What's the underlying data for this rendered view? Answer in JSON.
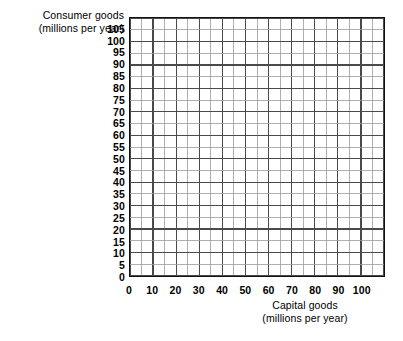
{
  "chart_data": {
    "type": "grid",
    "title": "",
    "ylabel_line1": "Consumer goods",
    "ylabel_line2": "(millions per year)",
    "xlabel_line1": "Capital goods",
    "xlabel_line2": "(millions per year)",
    "xlim": [
      0,
      110
    ],
    "ylim": [
      0,
      110
    ],
    "x_major_step": 10,
    "x_minor_step": 5,
    "y_major_step": 10,
    "y_minor_step": 5,
    "xticklabels": [
      "0",
      "10",
      "20",
      "30",
      "40",
      "50",
      "60",
      "70",
      "80",
      "90",
      "100"
    ],
    "xtickvalues": [
      0,
      10,
      20,
      30,
      40,
      50,
      60,
      70,
      80,
      90,
      100
    ],
    "yticklabels": [
      "0",
      "5",
      "10",
      "15",
      "20",
      "25",
      "30",
      "35",
      "40",
      "45",
      "50",
      "55",
      "60",
      "65",
      "70",
      "75",
      "80",
      "85",
      "90",
      "95",
      "100",
      "105"
    ],
    "ytickvalues": [
      0,
      5,
      10,
      15,
      20,
      25,
      30,
      35,
      40,
      45,
      50,
      55,
      60,
      65,
      70,
      75,
      80,
      85,
      90,
      95,
      100,
      105
    ],
    "grid": true,
    "legend": null,
    "series": [],
    "values": [],
    "annotations": [],
    "colors": {
      "frame": "#111111",
      "grid_major": "#4a4a4a",
      "grid_minor": "#9a9a9a",
      "background": "#ffffff",
      "text": "#000000"
    }
  }
}
